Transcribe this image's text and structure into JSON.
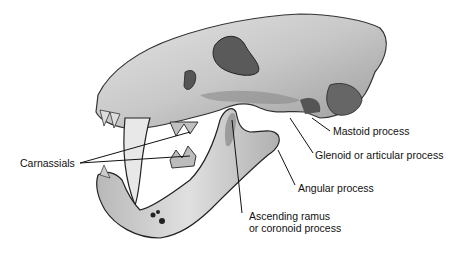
{
  "figure": {
    "labels": {
      "carnassials": "Carnassials",
      "mastoid": "Mastoid process",
      "glenoid": "Glenoid or articular process",
      "angular": "Angular process",
      "ascending_1": "Ascending ramus",
      "ascending_2": "or coronoid process"
    }
  }
}
